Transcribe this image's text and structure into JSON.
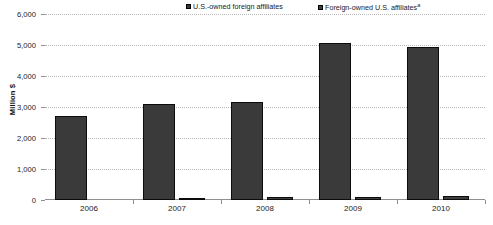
{
  "chart_data": {
    "type": "bar",
    "title": "",
    "xlabel": "",
    "ylabel": "Million $",
    "ylim": [
      0,
      6000
    ],
    "ytick_values": [
      0,
      1000,
      2000,
      3000,
      4000,
      5000,
      6000
    ],
    "ytick_labels": [
      "0",
      "1,000",
      "2,000",
      "3,000",
      "4,000",
      "5,000",
      "6,000"
    ],
    "categories": [
      "2006",
      "2007",
      "2008",
      "2009",
      "2010"
    ],
    "grid": true,
    "grid_style": "dotted horizontal",
    "legend_position": "top",
    "series": [
      {
        "name": "U.S.-owned foreign affiliates",
        "values": [
          2700,
          3110,
          3170,
          5080,
          4950
        ],
        "color": "#3a3a3a"
      },
      {
        "name": "Foreign-owned U.S. affiliates",
        "name_suffix": "a",
        "values": [
          0,
          60,
          90,
          110,
          130
        ],
        "color": "#3f3f3f"
      }
    ]
  },
  "legend": {
    "items": [
      {
        "label": "U.S.-owned foreign affiliates",
        "suffix": ""
      },
      {
        "label": "Foreign-owned U.S. affiliates",
        "suffix": "a"
      }
    ]
  },
  "axes": {
    "y_title": "Million $"
  },
  "footnote": {
    "text": ""
  }
}
